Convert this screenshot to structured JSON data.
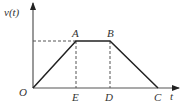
{
  "diagram": {
    "axes": {
      "y_label": "v(t)",
      "x_label": "t",
      "origin_label": "O"
    },
    "points": {
      "A": "A",
      "B": "B",
      "C": "C",
      "D": "D",
      "E": "E"
    },
    "colors": {
      "line": "#222222",
      "dashed": "#555555",
      "axis": "#555555"
    }
  }
}
